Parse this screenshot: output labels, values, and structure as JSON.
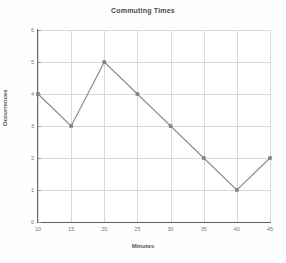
{
  "chart_data": {
    "type": "line",
    "title": "Commuting Times",
    "xlabel": "Minutes",
    "ylabel": "Occurrences",
    "x": [
      10,
      15,
      20,
      25,
      30,
      35,
      40,
      45
    ],
    "values": [
      4,
      3,
      5,
      4,
      3,
      2,
      1,
      2
    ],
    "series": [
      {
        "name": "Occurrences",
        "values": [
          4,
          3,
          5,
          4,
          3,
          2,
          1,
          2
        ]
      }
    ],
    "xticks": [
      "10",
      "15",
      "20",
      "25",
      "30",
      "35",
      "40",
      "45"
    ],
    "yticks": [
      "0",
      "1",
      "2",
      "3",
      "4",
      "5",
      "6"
    ],
    "xlim": [
      10,
      45
    ],
    "ylim": [
      0,
      6
    ],
    "grid": true,
    "legend": false,
    "legend_position": "none",
    "line_color": "#8c8c8c",
    "marker_color": "#808080",
    "marker_shape": "square",
    "axis_color": "#5e5e5e",
    "grid_color": "#d9d9d9",
    "background_color": "#ffffff",
    "text_color": "#555555"
  }
}
